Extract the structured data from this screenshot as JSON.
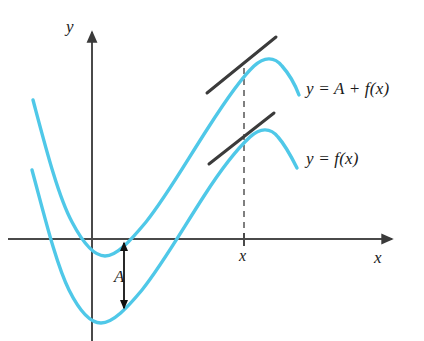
{
  "figure": {
    "kind": "math-diagram",
    "title_visible": false,
    "background_color": "#ffffff",
    "width": 424,
    "height": 341
  },
  "colors": {
    "curve": "#4FC8E8",
    "axis": "#4a4a4a",
    "tangent": "#3b3b3b",
    "arrow": "#1a1a1a",
    "dashed": "#555555",
    "text": "#1a1a1a"
  },
  "axes": {
    "x_axis": {
      "label": "x",
      "label_position": {
        "x": 374,
        "y": 249
      },
      "y_pixel": 239,
      "x_start": 8,
      "x_end": 396,
      "arrow": "right"
    },
    "y_axis": {
      "label": "y",
      "label_position": {
        "x": 66,
        "y": 18
      },
      "x_pixel": 92,
      "y_start": 28,
      "y_end": 341,
      "arrow": "up"
    }
  },
  "curves": [
    {
      "name": "upper-curve",
      "label": "y = A + f(x)",
      "label_position": {
        "x": 306,
        "y": 88
      },
      "color": "#4FC8E8",
      "description": "cubic-like curve, translated upward by A",
      "path_points": [
        {
          "x": 33,
          "y": 100
        },
        {
          "x": 52,
          "y": 170
        },
        {
          "x": 70,
          "y": 218
        },
        {
          "x": 86,
          "y": 246
        },
        {
          "x": 105,
          "y": 256
        },
        {
          "x": 124,
          "y": 248
        },
        {
          "x": 145,
          "y": 225
        },
        {
          "x": 175,
          "y": 180
        },
        {
          "x": 205,
          "y": 132
        },
        {
          "x": 230,
          "y": 92
        },
        {
          "x": 250,
          "y": 68
        },
        {
          "x": 266,
          "y": 59
        },
        {
          "x": 278,
          "y": 61
        },
        {
          "x": 290,
          "y": 75
        },
        {
          "x": 299,
          "y": 95
        }
      ]
    },
    {
      "name": "lower-curve",
      "label": "y = f(x)",
      "label_position": {
        "x": 306,
        "y": 158
      },
      "color": "#4FC8E8",
      "description": "original function curve",
      "path_points": [
        {
          "x": 32,
          "y": 170
        },
        {
          "x": 50,
          "y": 232
        },
        {
          "x": 66,
          "y": 282
        },
        {
          "x": 82,
          "y": 312
        },
        {
          "x": 100,
          "y": 323
        },
        {
          "x": 120,
          "y": 315
        },
        {
          "x": 142,
          "y": 292
        },
        {
          "x": 172,
          "y": 248
        },
        {
          "x": 200,
          "y": 202
        },
        {
          "x": 226,
          "y": 162
        },
        {
          "x": 246,
          "y": 139
        },
        {
          "x": 262,
          "y": 131
        },
        {
          "x": 275,
          "y": 134
        },
        {
          "x": 287,
          "y": 148
        },
        {
          "x": 297,
          "y": 168
        }
      ]
    }
  ],
  "tangents": [
    {
      "name": "upper-tangent-line",
      "from": {
        "x": 207,
        "y": 93
      },
      "to": {
        "x": 276,
        "y": 37
      },
      "touches_curve": "upper-curve"
    },
    {
      "name": "lower-tangent-line",
      "from": {
        "x": 209,
        "y": 164
      },
      "to": {
        "x": 274,
        "y": 113
      },
      "touches_curve": "lower-curve"
    }
  ],
  "dashed_line": {
    "name": "x-value-guide",
    "x": 244,
    "y_top": 68,
    "y_bottom": 239
  },
  "tick": {
    "label": "x",
    "x": 244,
    "label_position": {
      "x": 239,
      "y": 249
    },
    "tick_top": 234,
    "tick_bottom": 245
  },
  "gap_annotation": {
    "name": "vertical-shift-A",
    "label": "A",
    "label_position": {
      "x": 114,
      "y": 270
    },
    "arrow_x": 124,
    "arrow_top_y": 240,
    "arrow_bottom_y": 310,
    "meaning": "constant vertical translation between the two curves"
  }
}
